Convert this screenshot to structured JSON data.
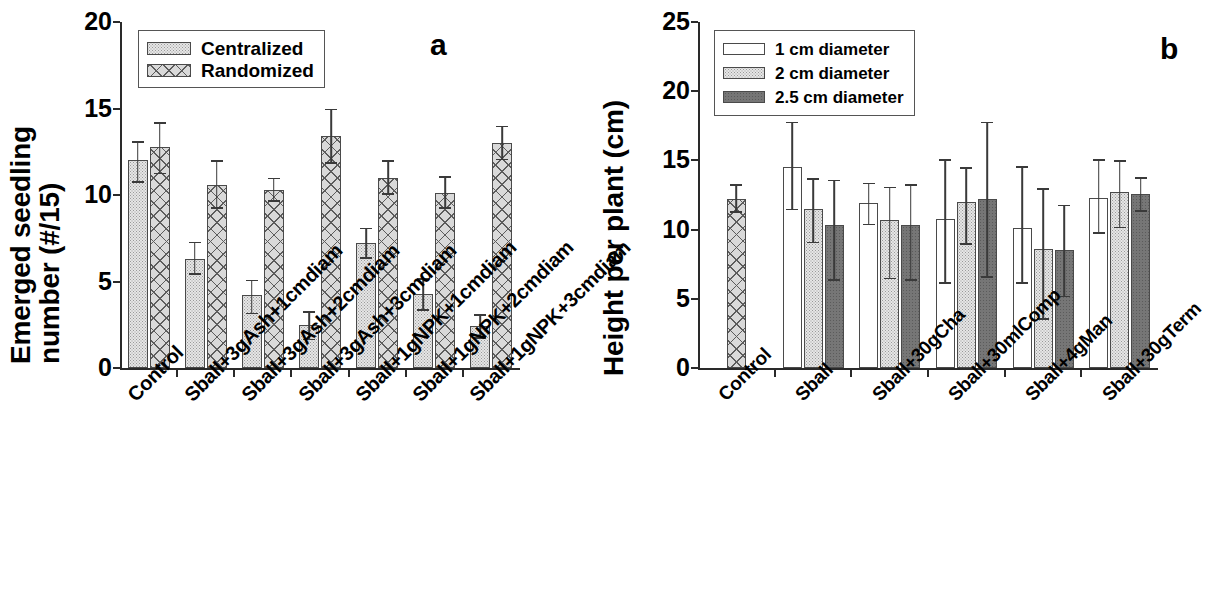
{
  "figure": {
    "panel_a_letter": "a",
    "panel_b_letter": "b"
  },
  "panel_a": {
    "ylabel_line1": "Emerged seedling",
    "ylabel_line2": "number (#/15)",
    "yticks": [
      "0",
      "5",
      "10",
      "15",
      "20"
    ],
    "legend": [
      {
        "label": "Centralized",
        "swatch": "stipple"
      },
      {
        "label": "Randomized",
        "swatch": "cross"
      }
    ]
  },
  "panel_b": {
    "ylabel": "Height per plant (cm)",
    "yticks": [
      "0",
      "5",
      "10",
      "15",
      "20",
      "25"
    ],
    "legend": [
      {
        "label": "1 cm diameter",
        "swatch": "open"
      },
      {
        "label": "2 cm diameter",
        "swatch": "stipple"
      },
      {
        "label": "2.5 cm diameter",
        "swatch": "dark"
      }
    ]
  },
  "chart_data": [
    {
      "type": "bar",
      "panel": "a",
      "title": "",
      "xlabel": "",
      "ylabel": "Emerged seedling number (#/15)",
      "ylim": [
        0,
        20
      ],
      "yticks": [
        0,
        5,
        10,
        15,
        20
      ],
      "grid": false,
      "legend_position": "top-left",
      "errorbars": "mean +/- SD (upper and lower whiskers)",
      "categories": [
        "Control",
        "Sball+3gAsh+1cmdiam",
        "Sball+3gAsh+2cmdiam",
        "Sball+3gAsh+3cmdiam",
        "Sball+1gNPK+1cmdiam",
        "Sball+1gNPK+2cmdiam",
        "Sball+1gNPK+3cmdiam"
      ],
      "series": [
        {
          "name": "Centralized",
          "values": [
            12.0,
            6.3,
            4.2,
            2.5,
            7.2,
            4.3,
            2.4
          ],
          "err_upper": [
            13.1,
            7.3,
            5.1,
            3.3,
            8.1,
            5.2,
            3.1
          ],
          "err_lower": [
            10.7,
            5.4,
            3.1,
            1.6,
            6.3,
            3.3,
            1.7
          ]
        },
        {
          "name": "Randomized",
          "values": [
            12.8,
            10.6,
            10.3,
            13.4,
            11.0,
            10.1,
            13.0
          ],
          "err_upper": [
            14.2,
            12.0,
            11.0,
            15.0,
            12.0,
            11.1,
            14.0
          ],
          "err_lower": [
            11.2,
            9.2,
            9.6,
            11.8,
            10.0,
            9.2,
            12.0
          ]
        }
      ]
    },
    {
      "type": "bar",
      "panel": "b",
      "title": "",
      "xlabel": "",
      "ylabel": "Height per plant (cm)",
      "ylim": [
        0,
        25
      ],
      "yticks": [
        0,
        5,
        10,
        15,
        20,
        25
      ],
      "grid": false,
      "legend_position": "top-left",
      "errorbars": "mean +/- SD (upper and lower whiskers)",
      "categories": [
        "Control",
        "Sball",
        "Sball+30gCha",
        "Sball+30mlComp",
        "Sball+4gMan",
        "Sball+30gTerm"
      ],
      "control_series_name": "Control (randomized)",
      "control_value": 12.2,
      "control_err_upper": 13.3,
      "control_err_lower": 11.2,
      "series": [
        {
          "name": "1 cm diameter",
          "values": [
            null,
            14.5,
            11.9,
            10.8,
            10.1,
            12.3
          ],
          "err_upper": [
            null,
            17.8,
            13.4,
            15.1,
            14.6,
            15.1
          ],
          "err_lower": [
            null,
            11.4,
            10.3,
            6.1,
            6.1,
            9.7
          ]
        },
        {
          "name": "2 cm diameter",
          "values": [
            null,
            11.5,
            10.7,
            12.0,
            8.6,
            12.7
          ],
          "err_upper": [
            null,
            13.7,
            13.1,
            14.5,
            13.0,
            15.0
          ],
          "err_lower": [
            null,
            9.0,
            6.4,
            8.9,
            3.5,
            10.1
          ]
        },
        {
          "name": "2.5 cm diameter",
          "values": [
            null,
            10.3,
            10.3,
            12.2,
            8.5,
            12.6
          ],
          "err_upper": [
            null,
            13.6,
            13.3,
            17.8,
            11.8,
            13.8
          ],
          "err_lower": [
            null,
            6.3,
            6.3,
            6.5,
            5.1,
            11.3
          ]
        }
      ]
    }
  ]
}
